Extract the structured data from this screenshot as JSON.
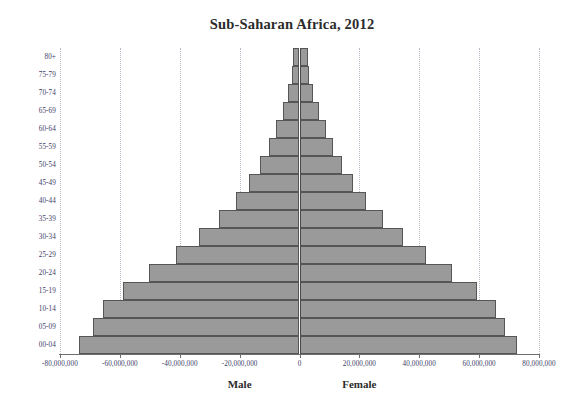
{
  "chart_data": {
    "type": "bar",
    "subtype": "population-pyramid",
    "title": "Sub-Saharan Africa, 2012",
    "xlabel": "",
    "ylabel": "",
    "xlim": [
      -80000000,
      80000000
    ],
    "grid": true,
    "legend_position": "none",
    "categories": [
      "80+",
      "75-79",
      "70-74",
      "65-69",
      "60-64",
      "55-59",
      "50-54",
      "45-49",
      "40-44",
      "35-39",
      "30-34",
      "25-29",
      "20-24",
      "15-19",
      "10-14",
      "05-09",
      "00-04"
    ],
    "x_tick_labels": [
      "-80,000,000",
      "-60,000,000",
      "-40,000,000",
      "-20,000,000",
      "0",
      "20,000,000",
      "40,000,000",
      "60,000,000",
      "80,000,000"
    ],
    "x_tick_values": [
      -80000000,
      -60000000,
      -40000000,
      -20000000,
      0,
      20000000,
      40000000,
      60000000,
      80000000
    ],
    "annotations": [
      {
        "text": "Male",
        "value": -20000000
      },
      {
        "text": "Female",
        "value": 20000000
      }
    ],
    "series": [
      {
        "name": "Male",
        "side": "left",
        "values": [
          2200000,
          2600000,
          3900000,
          5600000,
          7800000,
          10300000,
          13300000,
          16900000,
          21300000,
          26800000,
          33500000,
          41400000,
          50400000,
          58800000,
          65800000,
          69000000,
          73500000
        ]
      },
      {
        "name": "Female",
        "side": "right",
        "values": [
          2900000,
          3200000,
          4600000,
          6400000,
          8700000,
          11300000,
          14300000,
          17900000,
          22300000,
          27800000,
          34500000,
          42300000,
          51000000,
          59200000,
          65800000,
          68700000,
          72600000
        ]
      }
    ],
    "colors": {
      "bar_fill": "#9a9a9a",
      "bar_stroke": "#565656",
      "gridline": "#b9b9c6",
      "zero_line": "#4a4a4a",
      "axis_line": "#6e6e6e",
      "tick_label": "#3d3d66",
      "title": "#2b2b2b"
    }
  }
}
